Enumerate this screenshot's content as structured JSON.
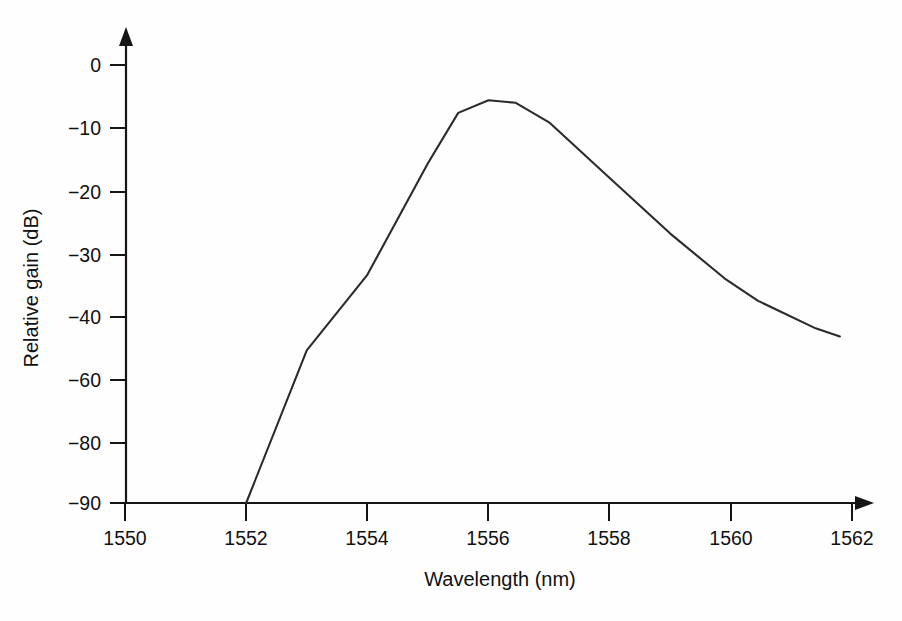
{
  "figure": {
    "background_color": "#fefefe",
    "line_color": "#2b2b2b",
    "axis_color": "#151515"
  },
  "chart_data": {
    "type": "line",
    "title": "",
    "subtitle": "",
    "xlabel": "Wavelength (nm)",
    "ylabel": "Relative gain (dB)",
    "xlim": [
      1549.2,
      1562.6
    ],
    "ylim": [
      -90,
      3
    ],
    "grid": false,
    "legend": [],
    "legend_position": "none",
    "x_ticks": [
      1550,
      1552,
      1554,
      1556,
      1558,
      1560,
      1562
    ],
    "x_tick_labels": [
      "1550",
      "1552",
      "1554",
      "1556",
      "1558",
      "1560",
      "1562"
    ],
    "y_ticks": [
      0,
      -10,
      -20,
      -30,
      -40,
      -60,
      -80,
      -90
    ],
    "y_tick_labels": [
      "0",
      "−10",
      "−20",
      "−30",
      "−40",
      "−60",
      "−80",
      "−90"
    ],
    "y_axis_note": "non-linear / compressed below -40 dB: equal spacing between 0,-10,-20,-30,-40,-60,-80,-90",
    "x_axis_arrow": true,
    "y_axis_arrow": true,
    "series": [
      {
        "name": "Relative gain",
        "x": [
          1552.0,
          1553.0,
          1554.0,
          1555.0,
          1555.5,
          1556.0,
          1556.45,
          1557.0,
          1558.0,
          1559.0,
          1559.9,
          1560.45,
          1561.4,
          1561.8
        ],
        "y": [
          -90.0,
          -50.6,
          -33.2,
          -15.5,
          -7.6,
          -5.6,
          -6.0,
          -9.1,
          -17.8,
          -26.6,
          -33.8,
          -37.4,
          -43.6,
          -46.2
        ],
        "marker": "none"
      }
    ],
    "annotations": []
  },
  "axis_titles": {
    "x": "Wavelength (nm)",
    "y": "Relative gain (dB)"
  },
  "y_labels": {
    "t0": "0",
    "t1": "−10",
    "t2": "−20",
    "t3": "−30",
    "t4": "−40",
    "t5": "−60",
    "t6": "−80",
    "t7": "−90"
  },
  "x_labels": {
    "t0": "1550",
    "t1": "1552",
    "t2": "1554",
    "t3": "1556",
    "t4": "1558",
    "t5": "1560",
    "t6": "1562"
  }
}
